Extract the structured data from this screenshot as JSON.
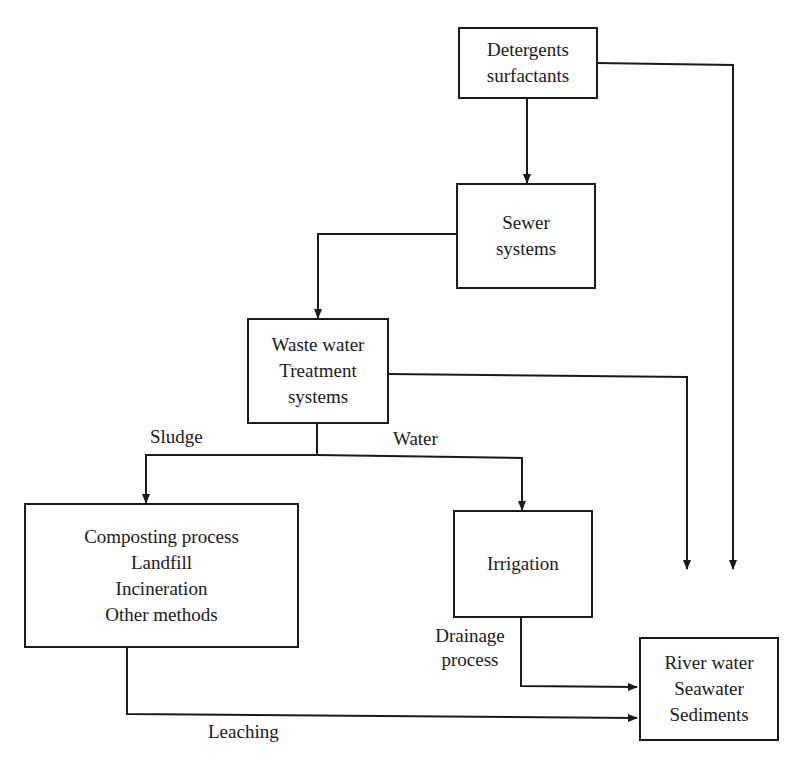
{
  "nodes": {
    "detergents": {
      "lines": [
        "Detergents",
        "surfactants"
      ]
    },
    "sewer": {
      "lines": [
        "Sewer",
        "systems"
      ]
    },
    "wwtp": {
      "lines": [
        "Waste water",
        "Treatment",
        "systems"
      ]
    },
    "disposal": {
      "lines": [
        "Composting process",
        "Landfill",
        "Incineration",
        "Other methods"
      ]
    },
    "irrigation": {
      "lines": [
        "Irrigation"
      ]
    },
    "receiving": {
      "lines": [
        "River water",
        "Seawater",
        "Sediments"
      ]
    }
  },
  "edge_labels": {
    "sludge": "Sludge",
    "water": "Water",
    "drainage_1": "Drainage",
    "drainage_2": "process",
    "leaching": "Leaching"
  },
  "colors": {
    "line": "#1a1a1a",
    "background": "#ffffff"
  }
}
